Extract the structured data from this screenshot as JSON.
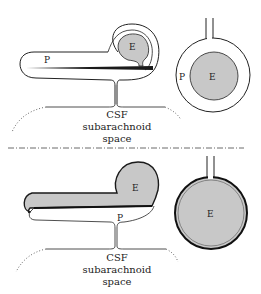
{
  "figure": {
    "panels": [
      {
        "id": "top",
        "labels": {
          "e": "E",
          "p": "P",
          "circle_e": "E",
          "circle_p": "P"
        },
        "caption": [
          "CSF",
          "subarachnoid",
          "space"
        ]
      },
      {
        "id": "bottom",
        "labels": {
          "e": "E",
          "p": "P",
          "circle_e": "E"
        },
        "caption": [
          "CSF",
          "subarachnoid",
          "space"
        ]
      }
    ],
    "colors": {
      "fill_grey": "#c8c8c8",
      "line": "#222222"
    }
  }
}
